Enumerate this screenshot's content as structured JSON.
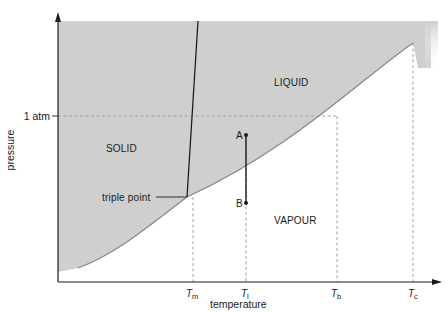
{
  "diagram": {
    "axes": {
      "x_label": "temperature",
      "y_label": "pressure",
      "y_tick": "1 atm"
    },
    "regions": {
      "solid": "SOLID",
      "liquid": "LIQUID",
      "vapour": "VAPOUR"
    },
    "annotations": {
      "triple_point": "triple point",
      "point_a": "A",
      "point_b": "B"
    },
    "x_ticks": [
      {
        "main": "T",
        "sub": "m"
      },
      {
        "main": "T",
        "sub": "l"
      },
      {
        "main": "T",
        "sub": "b"
      },
      {
        "main": "T",
        "sub": "c"
      }
    ],
    "colors": {
      "shaded_region": "#cfcfcf",
      "curve": "#8a8a8a",
      "axis": "#1a1a1a",
      "dashed": "#9a9a9a"
    }
  }
}
